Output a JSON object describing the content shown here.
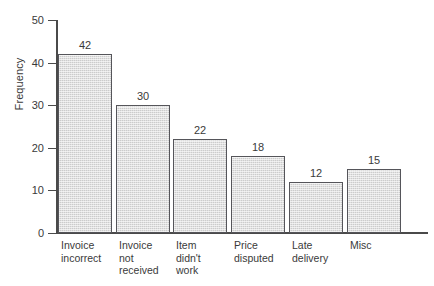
{
  "chart_data": {
    "type": "bar",
    "title": "",
    "xlabel": "",
    "ylabel": "Frequency",
    "categories": [
      "Invoice\nincorrect",
      "Invoice\nnot\nreceived",
      "Item\ndidn't\nwork",
      "Price\ndisputed",
      "Late\ndelivery",
      "Misc"
    ],
    "values": [
      42,
      30,
      22,
      18,
      12,
      15
    ],
    "value_labels": [
      "42",
      "30",
      "22",
      "18",
      "12",
      "15"
    ],
    "ylim": [
      0,
      50
    ],
    "ytick_labels": [
      "50",
      "40",
      "30",
      "20",
      "10",
      "0"
    ],
    "ytick_values": [
      50,
      40,
      30,
      20,
      10,
      0
    ],
    "grid": false,
    "legend": false,
    "legend_position": "none",
    "bar_fill_color": "#cccccc",
    "bar_edge_color": "#55555a",
    "axis_color": "#4a4a4a",
    "background_color": "#ffffff",
    "text_color": "#3a3a3a"
  }
}
